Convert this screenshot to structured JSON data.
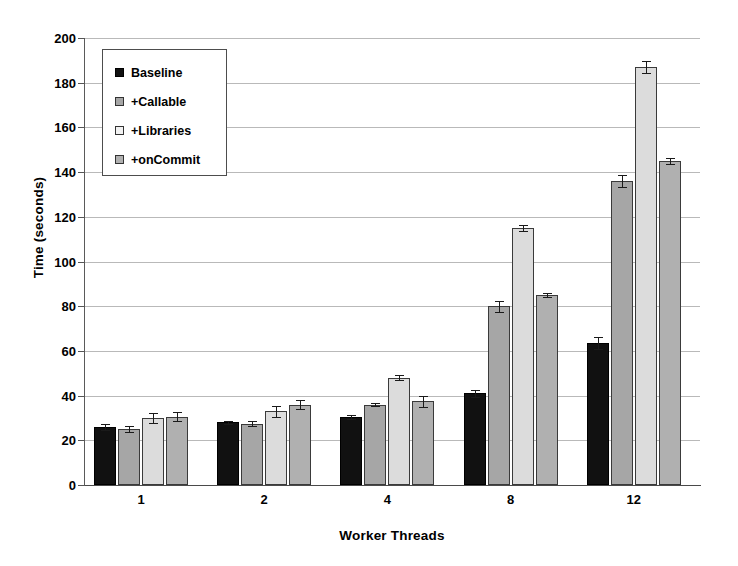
{
  "chart_data": {
    "type": "bar",
    "title": "",
    "xlabel": "Worker Threads",
    "ylabel": "Time (seconds)",
    "categories": [
      "1",
      "2",
      "4",
      "8",
      "12"
    ],
    "ylim": [
      0,
      200
    ],
    "yticks": [
      0,
      20,
      40,
      60,
      80,
      100,
      120,
      140,
      160,
      180,
      200
    ],
    "grid": true,
    "legend_position": "top-left",
    "series": [
      {
        "name": "Baseline",
        "color": "#111111",
        "values": [
          26,
          28,
          30.5,
          41,
          63.5
        ],
        "errors": [
          1.5,
          0.8,
          0.8,
          1.5,
          2.5
        ]
      },
      {
        "name": "+Callable",
        "color": "#a6a6a6",
        "values": [
          25,
          27.5,
          36,
          80,
          136
        ],
        "errors": [
          1.2,
          1.2,
          0.8,
          2.5,
          2.5
        ]
      },
      {
        "name": "+Libraries",
        "color": "#dcdcdc",
        "values": [
          30,
          33,
          48,
          115,
          187
        ],
        "errors": [
          2.2,
          2.5,
          1.2,
          1.5,
          2.5
        ]
      },
      {
        "name": "+onCommit",
        "color": "#b0b0b0",
        "values": [
          30.5,
          36,
          37.5,
          85,
          145
        ],
        "errors": [
          2.0,
          2.0,
          2.5,
          1.0,
          1.2
        ]
      }
    ]
  }
}
